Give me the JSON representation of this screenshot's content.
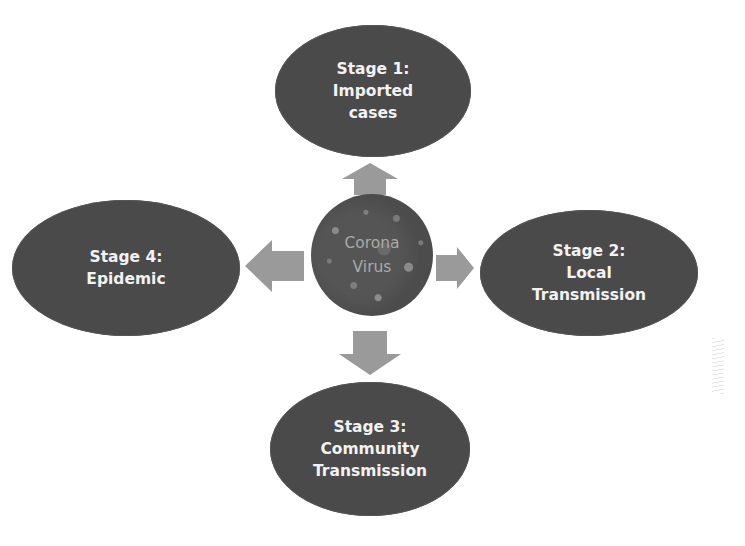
{
  "diagram": {
    "center": {
      "line1": "Corona",
      "line2": "Virus"
    },
    "stages": {
      "top": {
        "line1": "Stage 1:",
        "line2": "Imported",
        "line3": "cases"
      },
      "right": {
        "line1": "Stage 2:",
        "line2": "Local",
        "line3": "Transmission"
      },
      "bottom": {
        "line1": "Stage 3:",
        "line2": "Community",
        "line3": "Transmission"
      },
      "left": {
        "line1": "Stage 4:",
        "line2": "Epidemic"
      }
    },
    "colors": {
      "ellipse_fill": "#4a4a4a",
      "ellipse_text": "#f2f2f2",
      "arrow_fill": "#9a9a9a",
      "center_text": "#a9a9a9",
      "background": "#ffffff"
    }
  }
}
